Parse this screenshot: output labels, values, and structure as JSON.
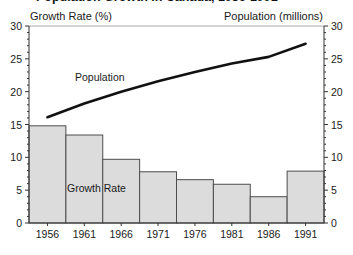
{
  "title": {
    "text": "Population Growth in Canada, 1956-1991"
  },
  "chart_data": {
    "type": "bar",
    "subtype": "combo-bar-line",
    "categories": [
      "1956",
      "1961",
      "1966",
      "1971",
      "1976",
      "1981",
      "1986",
      "1991"
    ],
    "series": [
      {
        "name": "Growth Rate",
        "render": "bar",
        "axis": "left",
        "values": [
          14.8,
          13.4,
          9.7,
          7.8,
          6.6,
          5.9,
          4.0,
          7.9
        ]
      },
      {
        "name": "Population",
        "render": "line",
        "axis": "right",
        "values": [
          16.1,
          18.2,
          20.0,
          21.6,
          23.0,
          24.3,
          25.3,
          27.3
        ]
      }
    ],
    "left_axis_label": "Growth Rate (%)",
    "right_axis_label": "Population (millions)",
    "ylim": [
      0,
      30
    ],
    "ytick_step": 5,
    "yminor_step": 1,
    "yticks": [
      0,
      5,
      10,
      15,
      20,
      25,
      30
    ],
    "grid": false,
    "legend_position": "none",
    "annotations": [
      {
        "text": "Population",
        "target": "line"
      },
      {
        "text": "Growth Rate",
        "target": "bars"
      }
    ],
    "colors": {
      "bar_fill": "#dcdcdc",
      "bar_stroke": "#4d4d4d",
      "line_color": "#111111",
      "axis_color": "#333333",
      "frame_top_color": "#aaaaaa"
    }
  }
}
